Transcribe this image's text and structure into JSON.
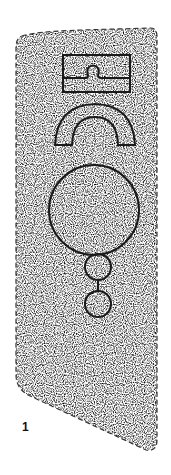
{
  "figure": {
    "label": "1",
    "colors": {
      "background": "#ffffff",
      "ink": "#1a1a1a",
      "stipple": "#9a9a9a"
    },
    "motifs": [
      {
        "name": "rectangle-with-notch",
        "type": "rectangle"
      },
      {
        "name": "horseshoe-arch",
        "type": "arch"
      },
      {
        "name": "large-circle",
        "type": "circle"
      },
      {
        "name": "small-circle-upper",
        "type": "circle"
      },
      {
        "name": "small-circle-lower",
        "type": "circle"
      }
    ]
  }
}
